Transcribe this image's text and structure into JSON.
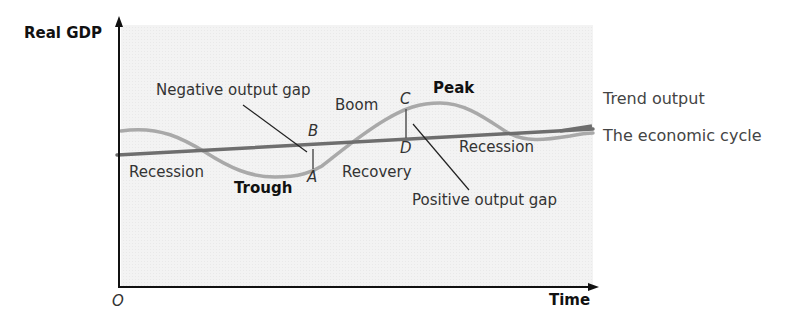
{
  "diagram": {
    "axes": {
      "y_label": "Real GDP",
      "x_label": "Time",
      "origin": "O"
    },
    "legend": {
      "trend": "Trend output",
      "cycle": "The economic cycle"
    },
    "phases": {
      "recession_1": "Recession",
      "trough": "Trough",
      "recovery": "Recovery",
      "boom": "Boom",
      "peak": "Peak",
      "recession_2": "Recession"
    },
    "points": {
      "a": "A",
      "b": "B",
      "c": "C",
      "d": "D"
    },
    "annotations": {
      "negative_gap": "Negative output gap",
      "positive_gap": "Positive output gap"
    },
    "colors": {
      "plot_background": "#f1f1f1",
      "trend_line": "#6e6e6e",
      "cycle_line": "#a9a9a9",
      "axis": "#111111"
    }
  }
}
